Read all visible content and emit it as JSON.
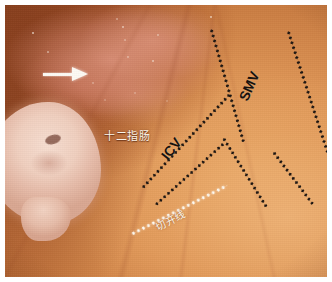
{
  "figure": {
    "kind": "surgical-endoscopic-photograph",
    "modality": "laparoscopic intraoperative view",
    "frame_color": "#ffffff",
    "tissue_palette": {
      "mesentery_light": "#e8a765",
      "mesentery_mid": "#cc7f44",
      "serosa_dark": "#8d3f1d",
      "mucosa_pink": "#e09680",
      "mass_pale": "#f6ddd0"
    }
  },
  "annotations": {
    "arrow": {
      "name": "white-pointer-arrow",
      "direction": "right",
      "color": "#fdfaf4"
    },
    "labels": [
      {
        "id": "duodenum",
        "text": "十二指肠",
        "romanization": "shi er zhi chang",
        "meaning": "duodenum",
        "color": "#fdf6ec",
        "rotation_deg": 0
      },
      {
        "id": "icv",
        "text": "ICV",
        "meaning": "ileocolic vein",
        "color": "#15100c",
        "rotation_deg": -52
      },
      {
        "id": "smv",
        "text": "SMV",
        "meaning": "superior mesenteric vein",
        "color": "#15100c",
        "rotation_deg": -66
      },
      {
        "id": "incision-line",
        "text": "切开线",
        "romanization": "qie kai xian",
        "meaning": "incision line",
        "color": "#fffaf0",
        "rotation_deg": -27
      }
    ],
    "dotted_lines": [
      {
        "id": "smv-left-border",
        "style": "black-dotted",
        "color": "#1b1410",
        "x": 206,
        "y": 22,
        "length": 118,
        "angle_deg": 74
      },
      {
        "id": "smv-right-border",
        "style": "black-dotted",
        "color": "#1b1410",
        "x": 283,
        "y": 24,
        "length": 160,
        "angle_deg": 72
      },
      {
        "id": "smv-lower-right-branch",
        "style": "black-dotted",
        "color": "#1b1410",
        "x": 268,
        "y": 145,
        "length": 66,
        "angle_deg": 53
      },
      {
        "id": "icv-upper-border",
        "style": "black-dotted",
        "color": "#1b1410",
        "x": 137,
        "y": 182,
        "length": 128,
        "angle_deg": -47
      },
      {
        "id": "icv-lower-border",
        "style": "black-dotted",
        "color": "#1b1410",
        "x": 150,
        "y": 199,
        "length": 92,
        "angle_deg": -42
      },
      {
        "id": "icv-descending-branch",
        "style": "black-dotted",
        "color": "#1b1410",
        "x": 218,
        "y": 131,
        "length": 82,
        "angle_deg": 58
      },
      {
        "id": "incision-line-path",
        "style": "white-dotted",
        "color": "#fffdf6",
        "x": 126,
        "y": 228,
        "length": 108,
        "angle_deg": -27
      }
    ]
  }
}
